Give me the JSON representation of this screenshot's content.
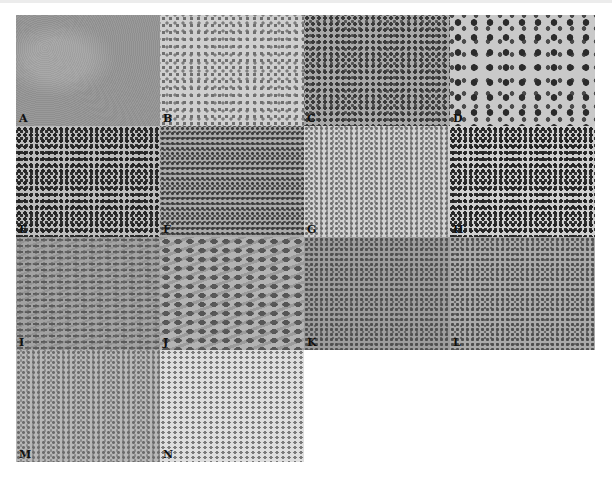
{
  "figure": {
    "panels": [
      {
        "id": "A",
        "label": "A",
        "row": 1,
        "col": 1,
        "appearance": "low-magnification tissue section"
      },
      {
        "id": "B",
        "label": "B",
        "row": 1,
        "col": 2,
        "appearance": "cellular sheet, medium magnification"
      },
      {
        "id": "C",
        "label": "C",
        "row": 1,
        "col": 3,
        "appearance": "dense dark cellular infiltrate"
      },
      {
        "id": "D",
        "label": "D",
        "row": 1,
        "col": 4,
        "appearance": "large pleomorphic cells, high magnification"
      },
      {
        "id": "E",
        "label": "E",
        "row": 2,
        "col": 1,
        "appearance": "round-cell infiltrate"
      },
      {
        "id": "F",
        "label": "F",
        "row": 2,
        "col": 2,
        "appearance": "dense small cells"
      },
      {
        "id": "G",
        "label": "G",
        "row": 2,
        "col": 3,
        "appearance": "pale background with dark aggregates"
      },
      {
        "id": "H",
        "label": "H",
        "row": 2,
        "col": 4,
        "appearance": "scattered dark nuclei"
      },
      {
        "id": "I",
        "label": "I",
        "row": 3,
        "col": 1,
        "appearance": "spindle-cell fascicles"
      },
      {
        "id": "J",
        "label": "J",
        "row": 3,
        "col": 2,
        "appearance": "spindle cells, higher magnification"
      },
      {
        "id": "K",
        "label": "K",
        "row": 3,
        "col": 3,
        "appearance": "diffuse cellular sheet"
      },
      {
        "id": "L",
        "label": "L",
        "row": 3,
        "col": 4,
        "appearance": "diffuse cellular sheet with fibrous strands"
      },
      {
        "id": "M",
        "label": "M",
        "row": 4,
        "col": 1,
        "appearance": "low-magnification dense region"
      },
      {
        "id": "N",
        "label": "N",
        "row": 4,
        "col": 2,
        "appearance": "low-magnification paler region"
      }
    ]
  }
}
